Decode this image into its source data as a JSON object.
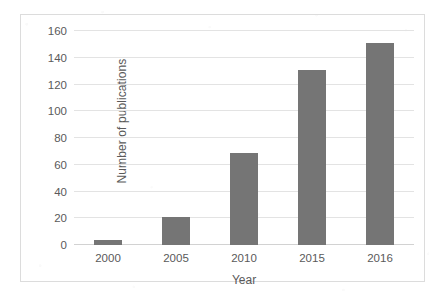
{
  "chart_data": {
    "type": "bar",
    "title": "",
    "xlabel": "Year",
    "ylabel": "Number of publications",
    "categories": [
      "2000",
      "2005",
      "2010",
      "2015",
      "2016"
    ],
    "values": [
      4,
      21,
      69,
      131,
      151
    ],
    "series": [
      {
        "name": "Number of publications",
        "values": [
          4,
          21,
          69,
          131,
          151
        ]
      }
    ],
    "ylim": [
      0,
      160
    ],
    "yticks": [
      0,
      20,
      40,
      60,
      80,
      100,
      120,
      140,
      160
    ],
    "ytick_labels": [
      "0",
      "20",
      "40",
      "60",
      "80",
      "100",
      "120",
      "140",
      "160"
    ],
    "grid": true,
    "grid_axis": "y",
    "legend": false,
    "legend_position": "none",
    "bar_color": "#757575",
    "gridline_color": "#e3e3e3",
    "text_color": "#5a5a5a",
    "border_color": "#dcdcdc",
    "background_color": "#ffffff"
  }
}
